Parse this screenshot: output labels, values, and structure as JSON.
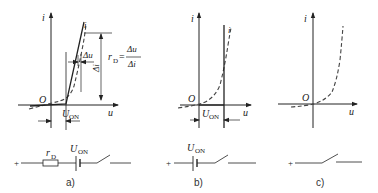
{
  "figure": {
    "panels": [
      {
        "id": "a",
        "caption": "a)",
        "axes": {
          "x_label": "u",
          "y_label": "i",
          "origin_label": "O"
        },
        "threshold_label": "U",
        "threshold_sub": "ON",
        "delta_u_label": "Δu",
        "delta_i_label": "Δi",
        "formula": {
          "lhs": "r",
          "lhs_sub": "D",
          "eq": "=",
          "num": "Δu",
          "den": "Δi"
        },
        "curve_label": "i",
        "circuit": {
          "plus": "+",
          "resistor_label": "r",
          "resistor_sub": "D",
          "source_label": "U",
          "source_sub": "ON"
        }
      },
      {
        "id": "b",
        "caption": "b)",
        "axes": {
          "x_label": "u",
          "y_label": "i",
          "origin_label": "O"
        },
        "threshold_label": "U",
        "threshold_sub": "ON",
        "curve_label": "i",
        "circuit": {
          "plus": "+",
          "source_label": "U",
          "source_sub": "ON"
        }
      },
      {
        "id": "c",
        "caption": "c)",
        "axes": {
          "x_label": "u",
          "y_label": "i",
          "origin_label": "O"
        },
        "circuit": {
          "plus": "+"
        }
      }
    ],
    "colors": {
      "line": "#222222",
      "dashed": "#444444"
    }
  }
}
